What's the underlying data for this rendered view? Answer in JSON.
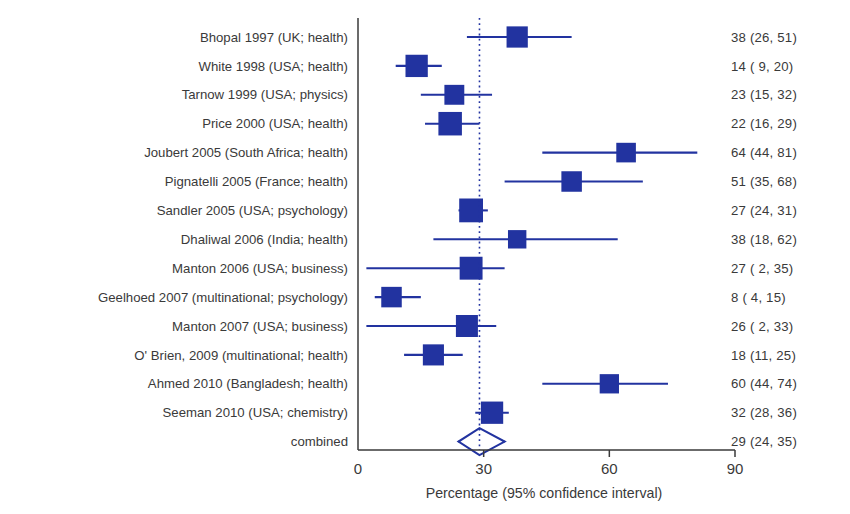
{
  "chart_data": {
    "type": "forest",
    "title": "",
    "xlabel": "Percentage  (95% confidence interval)",
    "ylabel": "",
    "xlim": [
      0,
      90
    ],
    "xticks": [
      0,
      30,
      60,
      90
    ],
    "xtick_labels": [
      "0",
      "30",
      "60",
      "90"
    ],
    "grid": false,
    "legend": "none",
    "reference_line": {
      "value": 29,
      "style": "dotted",
      "color": "#2233a0"
    },
    "marker_color": "#2233a0",
    "line_color": "#2233a0",
    "categories": [
      "Bhopal 1997 (UK; health)",
      "White 1998 (USA; health)",
      "Tarnow 1999 (USA; physics)",
      "Price 2000 (USA; health)",
      "Joubert 2005 (South Africa; health)",
      "Pignatelli 2005 (France; health)",
      "Sandler 2005 (USA; psychology)",
      "Dhaliwal 2006 (India; health)",
      "Manton 2006 (USA; business)",
      "Geelhoed 2007 (multinational; psychology)",
      "Manton 2007 (USA; business)",
      "O' Brien, 2009 (multinational; health)",
      "Ahmed 2010 (Bangladesh; health)",
      "Seeman 2010 (USA; chemistry)",
      "combined"
    ],
    "values": [
      38,
      14,
      23,
      22,
      64,
      51,
      27,
      38,
      27,
      8,
      26,
      18,
      60,
      32,
      29
    ],
    "ci_low": [
      26,
      9,
      15,
      16,
      44,
      35,
      24,
      18,
      2,
      4,
      2,
      11,
      44,
      28,
      24
    ],
    "ci_high": [
      51,
      20,
      32,
      29,
      81,
      68,
      31,
      62,
      35,
      15,
      33,
      25,
      74,
      36,
      35
    ],
    "weights": [
      0.55,
      0.62,
      0.46,
      0.7,
      0.44,
      0.5,
      0.72,
      0.36,
      0.66,
      0.5,
      0.6,
      0.54,
      0.42,
      0.62,
      0
    ],
    "stat_labels": [
      "38 (26, 51)",
      "14 (  9, 20)",
      "23 (15, 32)",
      "22 (16, 29)",
      "64 (44, 81)",
      "51 (35, 68)",
      "27 (24, 31)",
      "38 (18, 62)",
      "27 (  2, 35)",
      "  8 (  4, 15)",
      "26 (  2, 33)",
      "18 (11, 25)",
      "60 (44, 74)",
      "32 (28, 36)",
      "29 (24, 35)"
    ],
    "summary_index": 14,
    "summary_shape": "diamond"
  }
}
